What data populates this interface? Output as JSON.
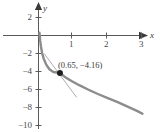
{
  "chart_data": {
    "type": "line",
    "title": "",
    "subtitle": "",
    "xlabel": "x",
    "ylabel": "y",
    "xlim": [
      -0.75,
      3.4
    ],
    "ylim": [
      -10.6,
      2.6
    ],
    "grid": false,
    "legend": null,
    "x_ticks": [
      {
        "value": 1,
        "label": "1"
      },
      {
        "value": 2,
        "label": "2"
      },
      {
        "value": 3,
        "label": "3"
      }
    ],
    "y_ticks": [
      {
        "value": 2,
        "label": "2"
      },
      {
        "value": -2,
        "label": "−2"
      },
      {
        "value": -4,
        "label": "−4"
      },
      {
        "value": -6,
        "label": "−6"
      },
      {
        "value": -8,
        "label": "−8"
      },
      {
        "value": -10,
        "label": "−10"
      }
    ],
    "series": [
      {
        "name": "curve",
        "type": "line",
        "color": "#8c8c8c",
        "points": [
          [
            0.03,
            0.3
          ],
          [
            0.05,
            -0.55
          ],
          [
            0.075,
            -1.25
          ],
          [
            0.11,
            -1.95
          ],
          [
            0.16,
            -2.6
          ],
          [
            0.23,
            -3.2
          ],
          [
            0.33,
            -3.75
          ],
          [
            0.45,
            -4.05
          ],
          [
            0.65,
            -4.16
          ],
          [
            0.8,
            -4.6
          ],
          [
            1.0,
            -5.05
          ],
          [
            1.25,
            -5.55
          ],
          [
            1.5,
            -6.0
          ],
          [
            1.8,
            -6.5
          ],
          [
            2.1,
            -6.95
          ],
          [
            2.4,
            -7.4
          ],
          [
            2.7,
            -7.9
          ],
          [
            3.0,
            -8.4
          ],
          [
            3.15,
            -8.7
          ]
        ]
      },
      {
        "name": "tangent-line",
        "type": "line",
        "color": "#aeaeae",
        "points": [
          [
            0.18,
            -2.05
          ],
          [
            1.15,
            -6.85
          ]
        ]
      }
    ],
    "markers": [
      {
        "name": "tangent-point",
        "x": 0.65,
        "y": -4.16,
        "color": "#1d1d1d",
        "label": "(0.65, −4.16)"
      }
    ],
    "annotations": [
      {
        "name": "point-coordinate-label",
        "text": "(0.65, −4.16)"
      }
    ],
    "axis_color": "#5a5a5a"
  },
  "axes": {
    "x_axis_name": "x",
    "y_axis_name": "y"
  }
}
